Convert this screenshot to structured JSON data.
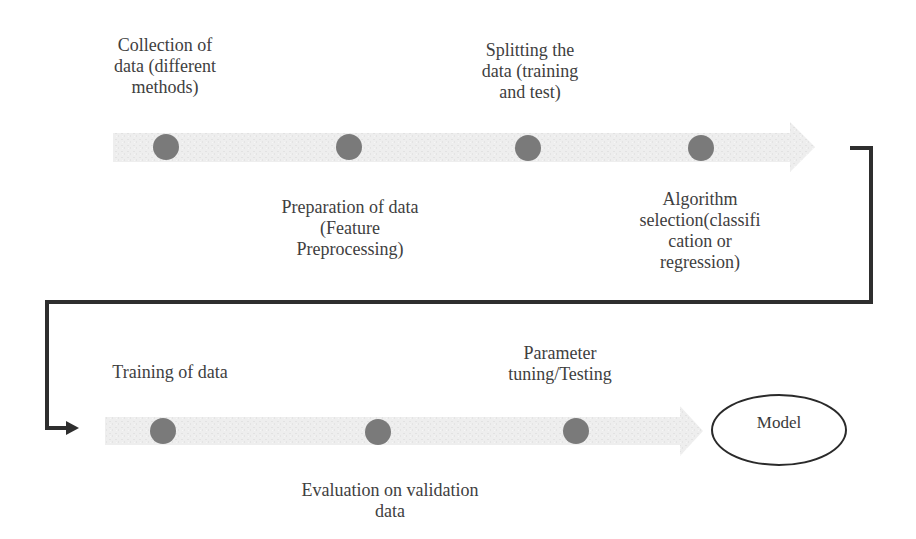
{
  "diagram": {
    "type": "process-flow",
    "colors": {
      "band": "#ececec",
      "dot": "#7a7a7a",
      "connector": "#2e2e2e",
      "text": "#404040"
    },
    "row1": {
      "steps": [
        {
          "label": "Collection of data (different methods)",
          "lines": [
            "Collection of",
            "data (different",
            "methods)"
          ]
        },
        {
          "label": "Preparation of data (Feature Preprocessing)",
          "lines": [
            "Preparation of data",
            "(Feature",
            "Preprocessing)"
          ]
        },
        {
          "label": "Splitting the data (training and test)",
          "lines": [
            "Splitting the",
            "data (training",
            "and test)"
          ]
        },
        {
          "label": "Algorithm selection(classification or regression)",
          "lines": [
            "Algorithm",
            "selection(classifi",
            "cation or",
            "regression)"
          ]
        }
      ]
    },
    "row2": {
      "steps": [
        {
          "label": "Training of data",
          "lines": [
            "Training of data"
          ]
        },
        {
          "label": "Evaluation on validation data",
          "lines": [
            "Evaluation on validation",
            "data"
          ]
        },
        {
          "label": "Parameter tuning/Testing",
          "lines": [
            "Parameter",
            "tuning/Testing"
          ]
        }
      ],
      "end_node": "Model"
    }
  }
}
